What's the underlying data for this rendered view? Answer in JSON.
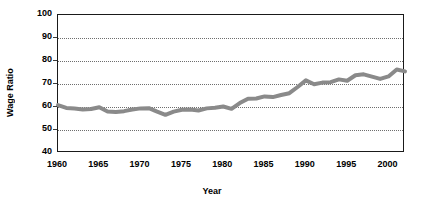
{
  "chart_data": {
    "type": "line",
    "title": "",
    "xlabel": "Year",
    "ylabel": "Wage Ratio",
    "xlim": [
      1960,
      2002
    ],
    "ylim": [
      40,
      100
    ],
    "grid": true,
    "grid_style": "dotted-horizontal",
    "legend": false,
    "legend_position": "none",
    "line_color": "#8a8a8a",
    "line_width_px": 4,
    "border_color": "#1a1a1a",
    "ytick_labels": [
      "100",
      "90",
      "80",
      "70",
      "60",
      "50",
      "40"
    ],
    "ytick_values": [
      100,
      90,
      80,
      70,
      60,
      50,
      40
    ],
    "xtick_labels": [
      "1960",
      "1965",
      "1970",
      "1975",
      "1980",
      "1985",
      "1990",
      "1995",
      "2000"
    ],
    "xtick_values": [
      1960,
      1965,
      1970,
      1975,
      1980,
      1985,
      1990,
      1995,
      2000
    ],
    "series": [
      {
        "name": "Wage Ratio",
        "x": [
          1960,
          1961,
          1962,
          1963,
          1964,
          1965,
          1966,
          1967,
          1968,
          1969,
          1970,
          1971,
          1972,
          1973,
          1974,
          1975,
          1976,
          1977,
          1978,
          1979,
          1980,
          1981,
          1982,
          1983,
          1984,
          1985,
          1986,
          1987,
          1988,
          1989,
          1990,
          1991,
          1992,
          1993,
          1994,
          1995,
          1996,
          1997,
          1998,
          1999,
          2000,
          2001,
          2002
        ],
        "values": [
          60.8,
          59.6,
          59.3,
          58.9,
          59.1,
          59.9,
          58.0,
          57.8,
          58.2,
          58.9,
          59.4,
          59.5,
          58.0,
          56.6,
          58.0,
          58.8,
          58.9,
          58.5,
          59.4,
          59.7,
          60.2,
          59.2,
          61.7,
          63.6,
          63.7,
          64.6,
          64.3,
          65.2,
          66.0,
          68.7,
          71.6,
          69.9,
          70.6,
          70.8,
          72.0,
          71.4,
          73.8,
          74.2,
          73.2,
          72.2,
          73.3,
          76.3,
          75.5
        ]
      }
    ]
  }
}
